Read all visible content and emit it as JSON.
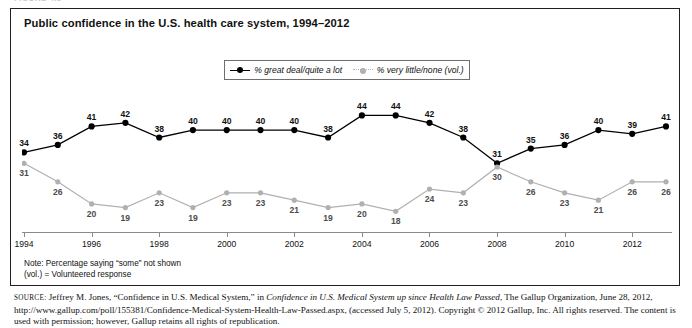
{
  "figure_stub": "FIGURE 4.5",
  "title": "Public confidence in the U.S. health care system, 1994–2012",
  "legend": {
    "series1_label": "% great deal/quite a lot",
    "series2_label": "% very little/none (vol.)"
  },
  "notes": {
    "line1": "Note: Percentage saying “some” not shown",
    "line2": "(vol.) = Volunteered response"
  },
  "source": {
    "prefix": "SOURCE:",
    "part1": " Jeffrey M. Jones, “Confidence in U.S. Medical System,” in ",
    "italic1": "Confidence in U.S. Medical System up since Health Law Passed",
    "part2": ", The Gallup Organization, June 28, 2012, http://www.gallup.com/poll/155381/Confidence-Medical-System-Health-Law-Passed.aspx, (accessed July 5, 2012). Copyright © 2012 Gallup, Inc. All rights reserved. The content is used with permission; however, Gallup retains all rights of republication."
  },
  "colors": {
    "series1": "#000000",
    "series2": "#b0b0b0",
    "frame": "#231f20",
    "axis": "#8a8a8a"
  },
  "chart_data": {
    "type": "line",
    "title": "Public confidence in the U.S. health care system, 1994–2012",
    "xlabel": "",
    "ylabel": "",
    "grid": false,
    "legend_position": "top-center",
    "ylim": [
      0,
      50
    ],
    "x": [
      1994,
      1995,
      1996,
      1997,
      1998,
      1999,
      2000,
      2001,
      2002,
      2003,
      2004,
      2005,
      2006,
      2007,
      2008,
      2009,
      2010,
      2011,
      2012,
      2013
    ],
    "categories": [
      "1994",
      "1995",
      "1996",
      "1997",
      "1998",
      "1999",
      "2000",
      "2001",
      "2002",
      "2003",
      "2004",
      "2005",
      "2006",
      "2007",
      "2008",
      "2009",
      "2010",
      "2011",
      "2012",
      "2013"
    ],
    "xtick_labels": [
      "1994",
      "1996",
      "1998",
      "2000",
      "2002",
      "2004",
      "2006",
      "2008",
      "2010",
      "2012"
    ],
    "xtick_indices": [
      0,
      2,
      4,
      6,
      8,
      10,
      12,
      14,
      16,
      18
    ],
    "series": [
      {
        "name": "% great deal/quite a lot",
        "color": "#000000",
        "label_position": "above",
        "values": [
          34,
          36,
          41,
          42,
          38,
          40,
          40,
          40,
          40,
          38,
          44,
          44,
          42,
          38,
          31,
          35,
          36,
          40,
          39,
          41
        ]
      },
      {
        "name": "% very little/none (vol.)",
        "color": "#b0b0b0",
        "label_position": "below",
        "values": [
          31,
          26,
          20,
          19,
          23,
          19,
          23,
          23,
          21,
          19,
          20,
          18,
          24,
          23,
          30,
          26,
          23,
          21,
          26,
          26
        ]
      }
    ]
  }
}
